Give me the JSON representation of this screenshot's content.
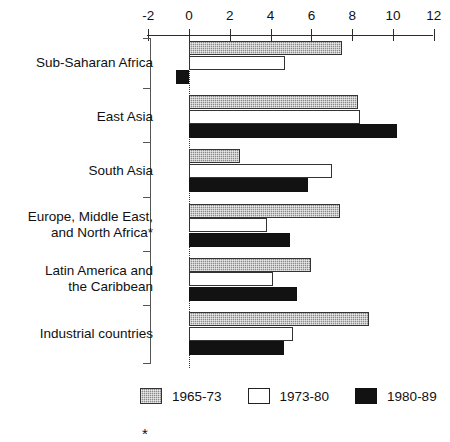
{
  "chart_data": {
    "type": "bar",
    "orientation": "horizontal",
    "title": "",
    "subtitle": "",
    "xlabel": "",
    "ylabel": "",
    "xlim": [
      -2,
      12
    ],
    "xticks": [
      -2,
      0,
      2,
      4,
      6,
      8,
      10,
      12
    ],
    "xtick_labels": [
      "-2",
      "0",
      "2",
      "4",
      "6",
      "8",
      "10",
      "12"
    ],
    "grid": false,
    "zero_line": true,
    "legend_position": "bottom",
    "categories": [
      "Sub-Saharan Africa",
      "East Asia",
      "South Asia",
      "Europe, Middle East,\nand North Africa*",
      "Latin America and\nthe Caribbean",
      "Industrial countries"
    ],
    "series": [
      {
        "name": "1965-73",
        "color": "#8a8a8a",
        "pattern": "checker",
        "values": [
          7.5,
          8.3,
          2.5,
          7.4,
          6.0,
          8.8
        ]
      },
      {
        "name": "1973-80",
        "color": "#ffffff",
        "pattern": "solid",
        "values": [
          4.7,
          8.4,
          7.0,
          3.8,
          4.1,
          5.1
        ]
      },
      {
        "name": "1980-89",
        "color": "#121212",
        "pattern": "solid",
        "values": [
          -0.65,
          10.2,
          5.85,
          4.95,
          5.3,
          4.65
        ]
      }
    ],
    "footnote_marker": "*"
  },
  "legend": {
    "items": [
      {
        "label": "1965-73"
      },
      {
        "label": "1973-80"
      },
      {
        "label": "1980-89"
      }
    ]
  }
}
